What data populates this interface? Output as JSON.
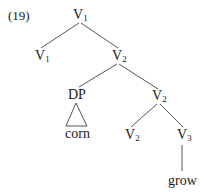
{
  "example_number": "(19)",
  "tree": {
    "nodes": [
      {
        "id": "v1_root",
        "cat": "V",
        "sub": "1"
      },
      {
        "id": "v1_head",
        "cat": "V",
        "sub": "1"
      },
      {
        "id": "v2_mid",
        "cat": "V",
        "sub": "2"
      },
      {
        "id": "dp",
        "cat": "DP",
        "sub": ""
      },
      {
        "id": "v2_bar",
        "cat": "V",
        "sub": "2"
      },
      {
        "id": "v2_head",
        "cat": "V",
        "sub": "2"
      },
      {
        "id": "v3",
        "cat": "V",
        "sub": "3"
      },
      {
        "id": "corn",
        "cat": "corn",
        "sub": ""
      },
      {
        "id": "grow",
        "cat": "grow",
        "sub": ""
      }
    ],
    "edges": [
      [
        "v1_root",
        "v1_head"
      ],
      [
        "v1_root",
        "v2_mid"
      ],
      [
        "v2_mid",
        "dp"
      ],
      [
        "v2_mid",
        "v2_bar"
      ],
      [
        "dp",
        "corn",
        "triangle"
      ],
      [
        "v2_bar",
        "v2_head"
      ],
      [
        "v2_bar",
        "v3"
      ],
      [
        "v3",
        "grow"
      ]
    ]
  },
  "colors": {
    "ink": "#1a1a1a",
    "line": "#555555",
    "background": "#ffffff"
  }
}
